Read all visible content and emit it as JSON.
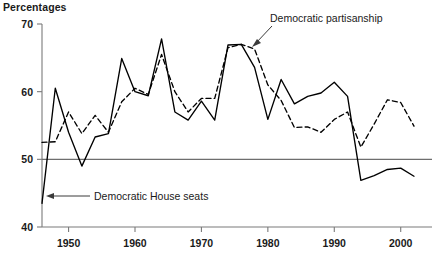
{
  "chart_data": {
    "type": "line",
    "title": "",
    "ylabel": "Percentages",
    "xlabel": "",
    "ylim": [
      40,
      70
    ],
    "yticks": [
      40,
      50,
      60,
      70
    ],
    "xlim": [
      1946,
      2002
    ],
    "xticks": [
      1950,
      1960,
      1970,
      1980,
      1990,
      2000
    ],
    "grid": false,
    "reference_line": 50,
    "legend": "annotations",
    "annotations": [
      {
        "text": "Democratic House seats",
        "series": "Democratic House seats",
        "x": 1946,
        "y": 43.5
      },
      {
        "text": "Democratic partisanship",
        "series": "Democratic partisanship",
        "x": 1978,
        "y": 66.8
      }
    ],
    "x": [
      1946,
      1948,
      1950,
      1952,
      1954,
      1956,
      1958,
      1960,
      1962,
      1964,
      1966,
      1968,
      1970,
      1972,
      1974,
      1976,
      1978,
      1980,
      1982,
      1984,
      1986,
      1988,
      1990,
      1992,
      1994,
      1996,
      1998,
      2000,
      2002
    ],
    "series": [
      {
        "name": "Democratic House seats",
        "style": "solid",
        "color": "#000000",
        "values": [
          43.5,
          60.5,
          54.0,
          49.0,
          53.3,
          53.8,
          64.9,
          60.0,
          59.4,
          67.8,
          57.0,
          55.8,
          58.6,
          55.8,
          66.9,
          67.0,
          63.6,
          55.9,
          61.8,
          58.2,
          59.3,
          59.8,
          61.4,
          59.3,
          46.9,
          47.6,
          48.5,
          48.7,
          47.5
        ]
      },
      {
        "name": "Democratic partisanship",
        "style": "dashed",
        "color": "#000000",
        "values": [
          52.5,
          52.6,
          57.0,
          53.8,
          56.5,
          54.0,
          58.5,
          60.5,
          59.6,
          65.5,
          60.0,
          57.0,
          59.0,
          59.0,
          66.5,
          67.0,
          66.3,
          61.0,
          58.7,
          54.7,
          54.8,
          54.0,
          55.9,
          57.0,
          51.8,
          55.2,
          58.8,
          58.4,
          54.9
        ]
      }
    ]
  },
  "axis": {
    "y_tick_labels": [
      "70",
      "60",
      "50",
      "40"
    ],
    "x_tick_labels": [
      "1950",
      "1960",
      "1970",
      "1980",
      "1990",
      "2000"
    ]
  },
  "labels": {
    "y_axis_title": "Percentages",
    "annotation_house": "Democratic House seats",
    "annotation_partisanship": "Democratic partisanship"
  },
  "colors": {
    "line": "#000000",
    "axis": "#7a7a7a",
    "reference": "#6e6e6e",
    "text": "#1a1a1a",
    "background": "#ffffff"
  }
}
